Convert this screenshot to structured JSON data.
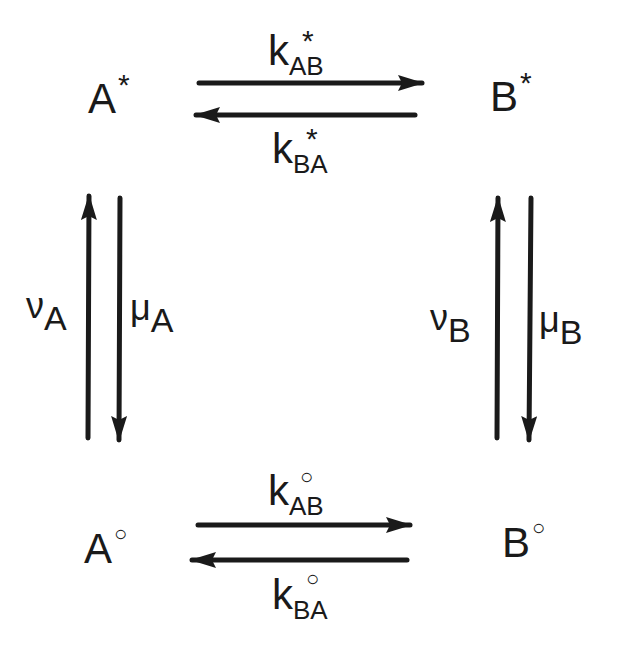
{
  "states": {
    "a_star": {
      "base": "A",
      "mark": "*"
    },
    "b_star": {
      "base": "B",
      "mark": "*"
    },
    "a_ground": {
      "base": "A",
      "mark": "○"
    },
    "b_ground": {
      "base": "B",
      "mark": "○"
    }
  },
  "rates": {
    "k_ab_star": {
      "base": "k",
      "mark": "*",
      "sub": "AB"
    },
    "k_ba_star": {
      "base": "k",
      "mark": "*",
      "sub": "BA"
    },
    "k_ab_ground": {
      "base": "k",
      "mark": "○",
      "sub": "AB"
    },
    "k_ba_ground": {
      "base": "k",
      "mark": "○",
      "sub": "BA"
    },
    "nu_a": {
      "base": "ν",
      "sub": "A"
    },
    "mu_a": {
      "base": "μ",
      "sub": "A"
    },
    "nu_b": {
      "base": "ν",
      "sub": "B"
    },
    "mu_b": {
      "base": "μ",
      "sub": "B"
    }
  },
  "colors": {
    "ink": "#1a1a1a",
    "background": "#ffffff"
  }
}
